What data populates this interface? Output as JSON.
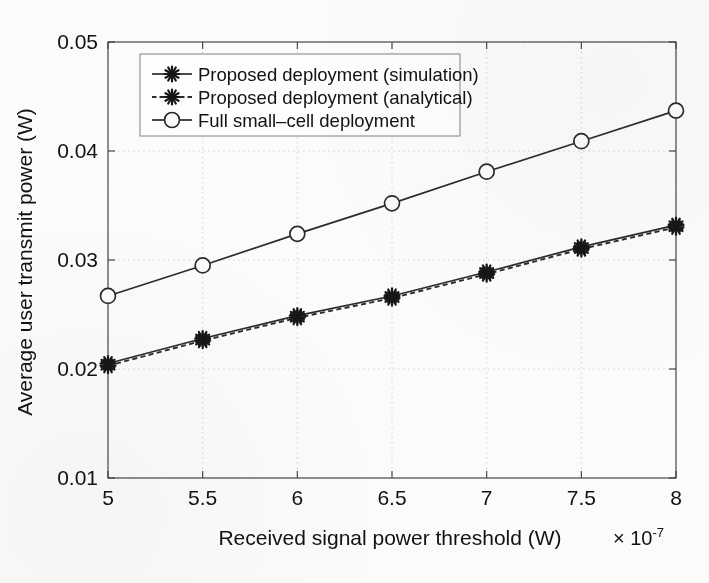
{
  "chart_data": {
    "type": "line",
    "title": "",
    "xlabel": "Received signal power threshold (W)",
    "ylabel": "Average user transmit power (W)",
    "x_multiplier": "× 10",
    "x_multiplier_exp": "-7",
    "xlim": [
      5,
      8
    ],
    "ylim": [
      0.01,
      0.05
    ],
    "xticks": [
      "5",
      "5.5",
      "6",
      "6.5",
      "7",
      "7.5",
      "8"
    ],
    "xtick_values": [
      5,
      5.5,
      6,
      6.5,
      7,
      7.5,
      8
    ],
    "yticks": [
      "0.01",
      "0.02",
      "0.03",
      "0.04",
      "0.05"
    ],
    "ytick_values": [
      0.01,
      0.02,
      0.03,
      0.04,
      0.05
    ],
    "grid": true,
    "grid_style": "dotted",
    "legend_position": "top-left",
    "x": [
      5,
      5.5,
      6,
      6.5,
      7,
      7.5,
      8
    ],
    "series": [
      {
        "name": "Proposed deployment (simulation)",
        "marker": "star",
        "linestyle": "solid",
        "color": "#2b2b2b",
        "values": [
          0.0205,
          0.0228,
          0.0249,
          0.0267,
          0.0289,
          0.0312,
          0.0332
        ]
      },
      {
        "name": "Proposed deployment (analytical)",
        "marker": "star",
        "linestyle": "dashed",
        "color": "#2b2b2b",
        "values": [
          0.0203,
          0.0226,
          0.0247,
          0.0265,
          0.0287,
          0.031,
          0.033
        ]
      },
      {
        "name": "Full small-cell deployment",
        "marker": "circle",
        "linestyle": "solid",
        "color": "#2b2b2b",
        "values": [
          0.0267,
          0.0295,
          0.0324,
          0.0352,
          0.0381,
          0.0409,
          0.0437
        ]
      }
    ]
  },
  "legend": {
    "entries": [
      "Proposed deployment (simulation)",
      "–∗– Proposed deployment (analytical)",
      "Full small–cell deployment"
    ],
    "items": [
      {
        "label": "Proposed deployment (simulation)"
      },
      {
        "label": "Proposed deployment (analytical)"
      },
      {
        "label": "Full small–cell deployment"
      }
    ]
  }
}
